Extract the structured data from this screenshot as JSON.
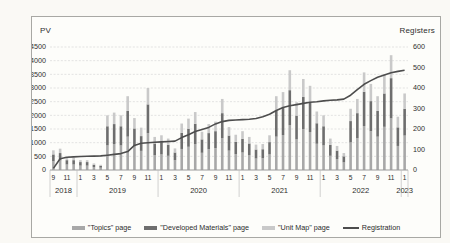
{
  "chart": {
    "left_axis_title": "PV",
    "right_axis_title": "Registers"
  },
  "colors": {
    "topics": "#a8a8a8",
    "developed": "#6e6e6e",
    "unitmap": "#c9c9c9",
    "registration_line": "#4d4d4d",
    "gridline": "#dcdcdc",
    "axis_text": "#2e2e2e",
    "frame_border": "#a8a8a4"
  },
  "legend": {
    "items": [
      {
        "label": "\"Topics\" page",
        "type": "bar",
        "color": "#a8a8a8"
      },
      {
        "label": "\"Developed Materials\" page",
        "type": "bar",
        "color": "#6e6e6e"
      },
      {
        "label": "\"Unit Map\" page",
        "type": "bar",
        "color": "#c9c9c9"
      },
      {
        "label": "Registration",
        "type": "line",
        "color": "#4d4d4d"
      }
    ]
  },
  "chart_data": {
    "type": "bar",
    "subtype": "stacked-bars-with-line",
    "months": [
      "2018-09",
      "2018-10",
      "2018-11",
      "2018-12",
      "2019-01",
      "2019-02",
      "2019-03",
      "2019-04",
      "2019-05",
      "2019-06",
      "2019-07",
      "2019-08",
      "2019-09",
      "2019-10",
      "2019-11",
      "2019-12",
      "2020-01",
      "2020-02",
      "2020-03",
      "2020-04",
      "2020-05",
      "2020-06",
      "2020-07",
      "2020-08",
      "2020-09",
      "2020-10",
      "2020-11",
      "2020-12",
      "2021-01",
      "2021-02",
      "2021-03",
      "2021-04",
      "2021-05",
      "2021-06",
      "2021-07",
      "2021-08",
      "2021-09",
      "2021-10",
      "2021-11",
      "2021-12",
      "2022-01",
      "2022-02",
      "2022-03",
      "2022-04",
      "2022-05",
      "2022-06",
      "2022-07",
      "2022-08",
      "2022-09",
      "2022-10",
      "2022-11",
      "2022-12",
      "2023-01"
    ],
    "year_groups": [
      {
        "label": "2018",
        "count": 4
      },
      {
        "label": "2019",
        "count": 12
      },
      {
        "label": "2020",
        "count": 12
      },
      {
        "label": "2021",
        "count": 12
      },
      {
        "label": "2022",
        "count": 12
      },
      {
        "label": "2023",
        "count": 1
      }
    ],
    "series": [
      {
        "name": "\"Topics\" page",
        "axis": "left",
        "color": "#a8a8a8",
        "values": [
          320,
          350,
          200,
          200,
          160,
          160,
          110,
          85,
          900,
          950,
          900,
          1220,
          860,
          700,
          1350,
          540,
          570,
          520,
          360,
          770,
          850,
          950,
          630,
          760,
          800,
          1170,
          710,
          580,
          640,
          540,
          420,
          430,
          570,
          1220,
          1280,
          1640,
          1120,
          1500,
          1390,
          960,
          900,
          520,
          400,
          280,
          1010,
          1170,
          1610,
          1420,
          1220,
          1580,
          1890,
          880,
          1260
        ]
      },
      {
        "name": "\"Developed Materials\" page",
        "axis": "left",
        "color": "#6e6e6e",
        "values": [
          250,
          270,
          160,
          160,
          130,
          130,
          80,
          65,
          700,
          730,
          700,
          940,
          660,
          540,
          1050,
          430,
          450,
          400,
          280,
          590,
          660,
          740,
          490,
          590,
          620,
          910,
          550,
          450,
          500,
          430,
          330,
          330,
          450,
          940,
          1000,
          1280,
          870,
          1170,
          1080,
          750,
          700,
          400,
          310,
          220,
          780,
          910,
          1250,
          1100,
          940,
          1220,
          1470,
          680,
          980
        ]
      },
      {
        "name": "\"Unit Map\" page",
        "axis": "left",
        "color": "#c9c9c9",
        "values": [
          150,
          160,
          90,
          90,
          70,
          70,
          50,
          40,
          400,
          420,
          400,
          540,
          380,
          310,
          600,
          240,
          250,
          230,
          150,
          340,
          370,
          430,
          280,
          330,
          350,
          520,
          310,
          260,
          280,
          240,
          180,
          190,
          250,
          540,
          570,
          730,
          490,
          660,
          610,
          430,
          400,
          230,
          170,
          120,
          450,
          520,
          710,
          630,
          540,
          700,
          840,
          390,
          560
        ]
      }
    ],
    "line": {
      "name": "Registration",
      "axis": "right",
      "color": "#4d4d4d",
      "values": [
        8,
        55,
        62,
        64,
        66,
        67,
        68,
        69,
        72,
        76,
        80,
        90,
        120,
        130,
        133,
        135,
        137,
        139,
        141,
        158,
        172,
        188,
        198,
        208,
        225,
        236,
        242,
        244,
        246,
        248,
        251,
        260,
        272,
        290,
        305,
        313,
        319,
        325,
        330,
        333,
        337,
        340,
        342,
        346,
        365,
        392,
        418,
        436,
        452,
        464,
        474,
        481,
        487
      ]
    },
    "left_axis": {
      "title": "PV",
      "min": 0,
      "max": 4500,
      "step": 500
    },
    "right_axis": {
      "title": "Registers",
      "min": 0,
      "max": 600,
      "step": 100
    },
    "grid": "horizontal-dashed",
    "legend_position": "bottom"
  }
}
